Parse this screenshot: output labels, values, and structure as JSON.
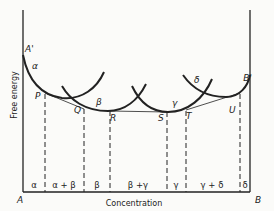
{
  "diagram": {
    "ylabel": "Free energy",
    "xlabel": "Concentration",
    "corner_left": "A",
    "corner_right": "B",
    "top_left_point": "A'",
    "top_right_point": "B'",
    "curves": [
      {
        "name": "alpha",
        "label": "α"
      },
      {
        "name": "beta",
        "label": "β"
      },
      {
        "name": "gamma",
        "label": "γ"
      },
      {
        "name": "delta",
        "label": "δ"
      }
    ],
    "points": [
      "P",
      "Q",
      "R",
      "S",
      "T",
      "U"
    ],
    "regions": [
      "α",
      "α + β",
      "β",
      "β +γ",
      "γ",
      "γ + δ",
      "δ"
    ]
  }
}
